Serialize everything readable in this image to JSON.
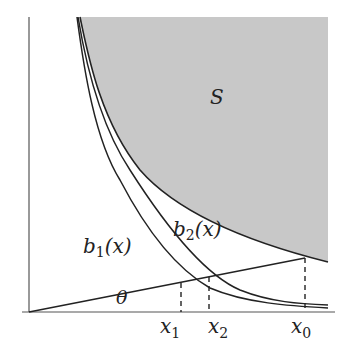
{
  "figure": {
    "colors": {
      "shade": "#c8c8c8",
      "stroke": "#222222",
      "background": "#ffffff"
    },
    "labels": {
      "region": "S",
      "curve_b1": {
        "base": "b",
        "sub": "1",
        "arg": "(x)"
      },
      "curve_b2": {
        "base": "b",
        "sub": "2",
        "arg": "(x)"
      },
      "angle": "θ",
      "x1": {
        "base": "x",
        "sub": "1"
      },
      "x2": {
        "base": "x",
        "sub": "2"
      },
      "x0": {
        "base": "x",
        "sub": "0"
      }
    }
  }
}
